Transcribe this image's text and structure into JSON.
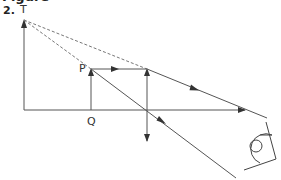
{
  "heading": "Figure",
  "question_number": "2.",
  "labels": {
    "image_top": "T",
    "object_top": "P",
    "object_base": "Q"
  },
  "colors": {
    "line": "#555555",
    "arrow": "#333333",
    "dashed": "#777777"
  },
  "diagram": {
    "type": "ray-diagram",
    "principal_axis_y": 110,
    "lens_x": 147,
    "object": {
      "x": 91,
      "top_y": 69
    },
    "image": {
      "x": 24,
      "top_y": 20
    }
  }
}
